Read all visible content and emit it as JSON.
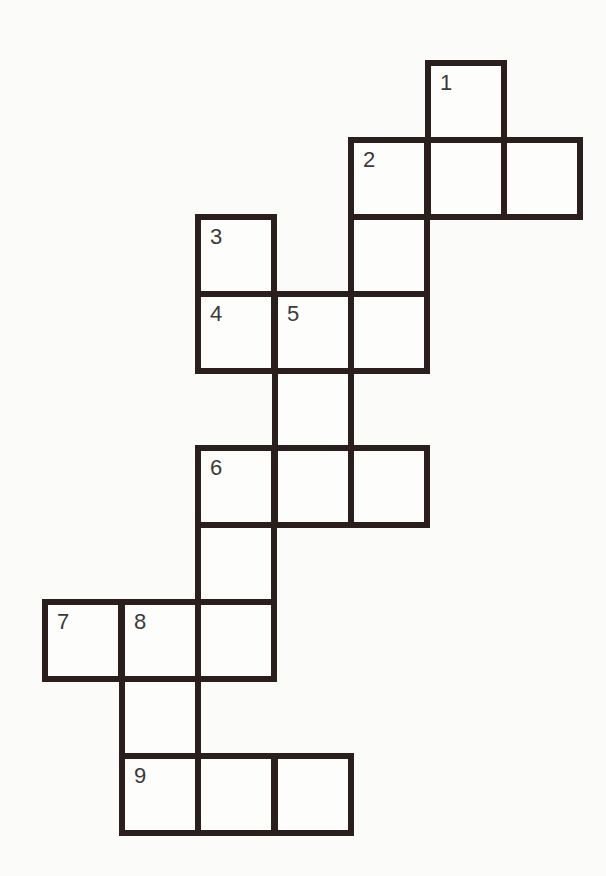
{
  "puzzle": {
    "type": "crossword",
    "pitch_x": 76.5,
    "pitch_y": 77,
    "origin_x": 42,
    "origin_y": 60,
    "border_color": "#2a1f1c",
    "cells": [
      {
        "col": 5,
        "row": 0,
        "num": "1"
      },
      {
        "col": 4,
        "row": 1,
        "num": "2"
      },
      {
        "col": 5,
        "row": 1,
        "num": ""
      },
      {
        "col": 6,
        "row": 1,
        "num": ""
      },
      {
        "col": 2,
        "row": 2,
        "num": "3"
      },
      {
        "col": 4,
        "row": 2,
        "num": ""
      },
      {
        "col": 2,
        "row": 3,
        "num": "4"
      },
      {
        "col": 3,
        "row": 3,
        "num": "5"
      },
      {
        "col": 4,
        "row": 3,
        "num": ""
      },
      {
        "col": 3,
        "row": 4,
        "num": ""
      },
      {
        "col": 2,
        "row": 5,
        "num": "6"
      },
      {
        "col": 3,
        "row": 5,
        "num": ""
      },
      {
        "col": 4,
        "row": 5,
        "num": ""
      },
      {
        "col": 2,
        "row": 6,
        "num": ""
      },
      {
        "col": 0,
        "row": 7,
        "num": "7"
      },
      {
        "col": 1,
        "row": 7,
        "num": "8"
      },
      {
        "col": 2,
        "row": 7,
        "num": ""
      },
      {
        "col": 1,
        "row": 8,
        "num": ""
      },
      {
        "col": 1,
        "row": 9,
        "num": "9"
      },
      {
        "col": 2,
        "row": 9,
        "num": ""
      },
      {
        "col": 3,
        "row": 9,
        "num": ""
      }
    ]
  }
}
